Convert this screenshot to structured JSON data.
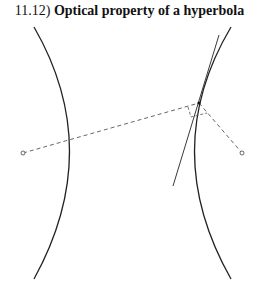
{
  "figure": {
    "number": "11.12)",
    "title": "Optical property of a hyperbola"
  },
  "diagram": {
    "elements": [
      "left-branch",
      "right-branch",
      "tangent-line",
      "left-focus",
      "right-focus",
      "point-on-curve",
      "focal-rays",
      "angle-marks"
    ],
    "stroke_color": "#222222",
    "dash_color": "#555555"
  }
}
